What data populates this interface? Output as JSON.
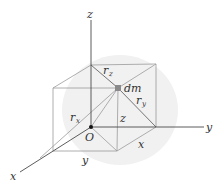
{
  "figure": {
    "width": 221,
    "height": 188,
    "background": "#ffffff",
    "shading_color": "#ececec",
    "line_color": "#555555",
    "light_line_color": "#9a9a9a",
    "axis_color": "#4a4a4a"
  },
  "axes": {
    "origin": {
      "x": 91,
      "y": 127,
      "label": "O"
    },
    "x_axis": {
      "label": "x",
      "end": {
        "x": 20,
        "y": 172
      }
    },
    "y_axis": {
      "label": "y",
      "end": {
        "x": 204,
        "y": 127
      }
    },
    "z_axis": {
      "label": "z",
      "end": {
        "x": 91,
        "y": 20
      }
    }
  },
  "box": {
    "vertices": {
      "O": {
        "x": 91,
        "y": 127
      },
      "Y": {
        "x": 156,
        "y": 127
      },
      "X": {
        "x": 53,
        "y": 151
      },
      "XY": {
        "x": 117,
        "y": 151
      },
      "Z": {
        "x": 91,
        "y": 65
      },
      "YZ": {
        "x": 156,
        "y": 64
      },
      "XZ": {
        "x": 53,
        "y": 88
      },
      "XYZ": {
        "x": 118,
        "y": 88
      }
    }
  },
  "point": {
    "label": "dm",
    "x": 118,
    "y": 88,
    "color": "#8a8a8a"
  },
  "labels": {
    "r_z": {
      "main": "r",
      "sub": "z"
    },
    "r_y": {
      "main": "r",
      "sub": "y"
    },
    "r_x": {
      "main": "r",
      "sub": "x"
    },
    "coord_z": "z",
    "coord_x": "x",
    "coord_y": "y"
  }
}
